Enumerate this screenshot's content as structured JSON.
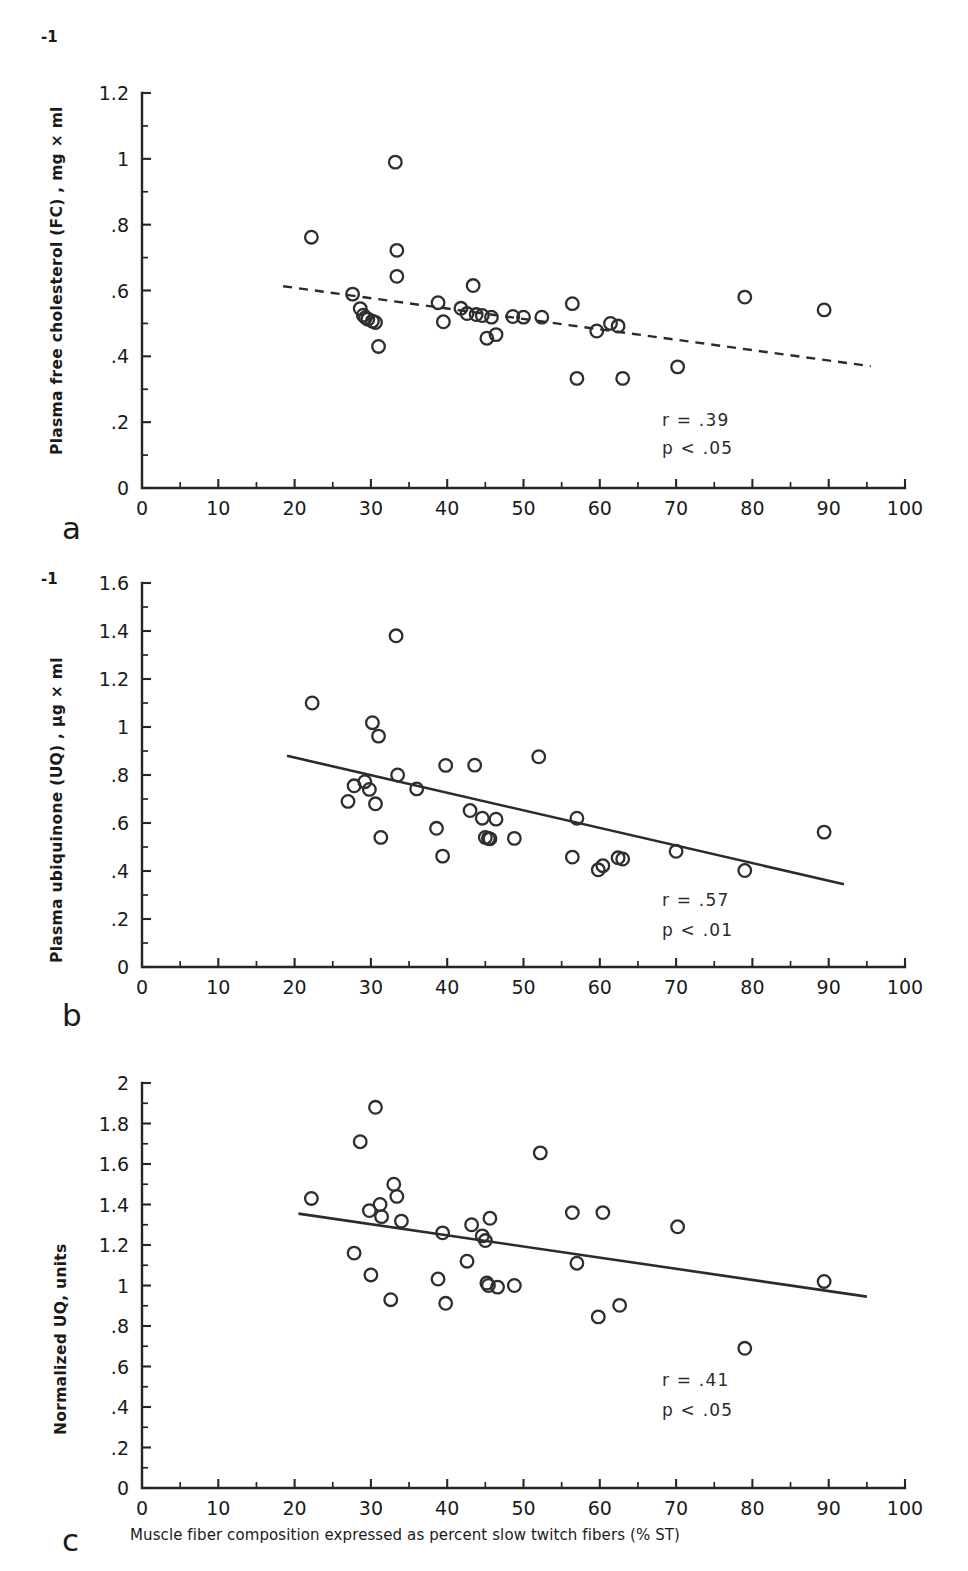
{
  "figure": {
    "xaxis_caption": "Muscle fiber composition expressed as percent slow twitch fibers (% ST)",
    "x_ticks": [
      "0",
      "10",
      "20",
      "30",
      "40",
      "50",
      "60",
      "70",
      "80",
      "90",
      "100"
    ],
    "superscript": "-1"
  },
  "panels": [
    {
      "letter": "a",
      "ylabel": "Plasma free cholesterol (FC) , mg × ml",
      "has_superscript": true,
      "y_ticks": [
        "0",
        ".2",
        ".4",
        ".6",
        ".8",
        "1",
        "1.2"
      ],
      "r_text": "r = .39",
      "p_text": "p < .05"
    },
    {
      "letter": "b",
      "ylabel": "Plasma ubiquinone (UQ) , µg × ml",
      "has_superscript": true,
      "y_ticks": [
        "0",
        ".2",
        ".4",
        ".6",
        ".8",
        "1",
        "1.2",
        "1.4",
        "1.6"
      ],
      "r_text": "r = .57",
      "p_text": "p < .01"
    },
    {
      "letter": "c",
      "ylabel": "Normalized UQ, units",
      "has_superscript": false,
      "y_ticks": [
        "0",
        ".2",
        ".4",
        ".6",
        ".8",
        "1",
        "1.2",
        "1.4",
        "1.6",
        "1.8",
        "2"
      ],
      "r_text": "r = .41",
      "p_text": "p < .05"
    }
  ],
  "chart_data": [
    {
      "type": "scatter",
      "panel": "a",
      "title": "",
      "xlabel": "Muscle fiber composition expressed as percent slow twitch fibers (% ST)",
      "ylabel": "Plasma free cholesterol (FC), mg × ml-1",
      "xlim": [
        0,
        100
      ],
      "ylim": [
        0,
        1.2
      ],
      "xticks": [
        0,
        10,
        20,
        30,
        40,
        50,
        60,
        70,
        80,
        90,
        100
      ],
      "yticks": [
        0,
        0.2,
        0.4,
        0.6,
        0.8,
        1.0,
        1.2
      ],
      "minor_tick_step_x": 5,
      "minor_tick_step_y": 0.1,
      "grid": false,
      "legend": null,
      "marker": "open-circle",
      "x": [
        22.2,
        27.6,
        28.6,
        29.0,
        29.3,
        29.6,
        30.2,
        30.6,
        31.0,
        33.2,
        33.4,
        33.4,
        38.8,
        39.5,
        41.8,
        42.6,
        43.4,
        43.8,
        44.6,
        45.2,
        45.8,
        46.4,
        48.6,
        50.0,
        52.4,
        56.4,
        57.0,
        59.6,
        61.4,
        62.4,
        63.0,
        70.2,
        79.0,
        89.4
      ],
      "y": [
        0.762,
        0.589,
        0.545,
        0.525,
        0.518,
        0.513,
        0.507,
        0.503,
        0.43,
        0.99,
        0.722,
        0.643,
        0.563,
        0.505,
        0.546,
        0.53,
        0.615,
        0.527,
        0.524,
        0.455,
        0.519,
        0.466,
        0.521,
        0.519,
        0.519,
        0.56,
        0.333,
        0.477,
        0.5,
        0.492,
        0.333,
        0.368,
        0.58,
        0.541
      ],
      "regression": {
        "style": "dashed",
        "x_start": 18.5,
        "x_end": 95.5,
        "y_start": 0.613,
        "y_end": 0.37
      },
      "annotations": [
        "r = .39",
        "p < .05"
      ]
    },
    {
      "type": "scatter",
      "panel": "b",
      "title": "",
      "xlabel": "Muscle fiber composition expressed as percent slow twitch fibers (% ST)",
      "ylabel": "Plasma ubiquinone (UQ), µg × ml-1",
      "xlim": [
        0,
        100
      ],
      "ylim": [
        0,
        1.6
      ],
      "xticks": [
        0,
        10,
        20,
        30,
        40,
        50,
        60,
        70,
        80,
        90,
        100
      ],
      "yticks": [
        0,
        0.2,
        0.4,
        0.6,
        0.8,
        1.0,
        1.2,
        1.4,
        1.6
      ],
      "minor_tick_step_x": 5,
      "minor_tick_step_y": 0.1,
      "grid": false,
      "legend": null,
      "marker": "open-circle",
      "x": [
        22.3,
        27.0,
        27.8,
        29.2,
        29.8,
        30.2,
        30.6,
        31.0,
        31.3,
        33.3,
        33.5,
        36.0,
        38.6,
        39.4,
        39.8,
        43.0,
        43.6,
        44.6,
        45.0,
        45.4,
        45.6,
        46.4,
        48.8,
        52.0,
        56.4,
        57.0,
        59.8,
        60.4,
        62.4,
        63.0,
        70.0,
        79.0,
        89.4
      ],
      "y": [
        1.1,
        0.69,
        0.755,
        0.772,
        0.74,
        1.018,
        0.68,
        0.962,
        0.54,
        1.38,
        0.8,
        0.742,
        0.578,
        0.462,
        0.84,
        0.652,
        0.841,
        0.62,
        0.54,
        0.536,
        0.534,
        0.616,
        0.536,
        0.876,
        0.458,
        0.62,
        0.405,
        0.422,
        0.455,
        0.45,
        0.482,
        0.402,
        0.562
      ],
      "regression": {
        "style": "solid",
        "x_start": 19.0,
        "x_end": 92.0,
        "y_start": 0.88,
        "y_end": 0.345
      },
      "annotations": [
        "r = .57",
        "p < .01"
      ]
    },
    {
      "type": "scatter",
      "panel": "c",
      "title": "",
      "xlabel": "Muscle fiber composition expressed as percent slow twitch fibers (% ST)",
      "ylabel": "Normalized UQ, units",
      "xlim": [
        0,
        100
      ],
      "ylim": [
        0,
        2.0
      ],
      "xticks": [
        0,
        10,
        20,
        30,
        40,
        50,
        60,
        70,
        80,
        90,
        100
      ],
      "yticks": [
        0,
        0.2,
        0.4,
        0.6,
        0.8,
        1.0,
        1.2,
        1.4,
        1.6,
        1.8,
        2.0
      ],
      "minor_tick_step_x": 5,
      "minor_tick_step_y": 0.1,
      "grid": false,
      "legend": null,
      "marker": "open-circle",
      "x": [
        22.2,
        27.8,
        28.6,
        29.8,
        30.0,
        30.6,
        31.2,
        31.4,
        32.6,
        33.0,
        33.4,
        34.0,
        38.8,
        39.4,
        39.8,
        42.6,
        43.2,
        44.6,
        45.0,
        45.2,
        45.4,
        45.6,
        46.6,
        48.8,
        52.2,
        56.4,
        57.0,
        59.8,
        60.4,
        62.6,
        70.2,
        79.0,
        89.4
      ],
      "y": [
        1.43,
        1.16,
        1.71,
        1.37,
        1.052,
        1.88,
        1.4,
        1.34,
        0.93,
        1.5,
        1.44,
        1.318,
        1.032,
        1.26,
        0.912,
        1.12,
        1.3,
        1.245,
        1.222,
        1.012,
        1.0,
        1.332,
        0.992,
        1.0,
        1.655,
        1.36,
        1.11,
        0.845,
        1.36,
        0.902,
        1.29,
        0.69,
        1.02
      ],
      "regression": {
        "style": "solid",
        "x_start": 20.5,
        "x_end": 95.0,
        "y_start": 1.355,
        "y_end": 0.945
      },
      "annotations": [
        "r = .41",
        "p < .05"
      ]
    }
  ]
}
